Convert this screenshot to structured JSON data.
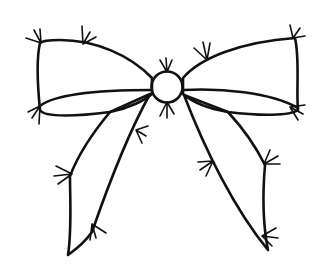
{
  "image": {
    "subject": "ribbon bow illustration",
    "description": "Black outline drawing of a bow with two loops, a round center knot and two hanging tails, filled with light gray grid texture, with small stitch/tick marks along the edges",
    "colors": {
      "background": "#ffffff",
      "outline": "#111111",
      "fill": "#e2e2e2",
      "fill_grid": "#cfcfcf"
    },
    "parts": [
      "left-loop",
      "right-loop",
      "center-knot",
      "left-tail",
      "right-tail"
    ],
    "stitch_mark_count": 14
  }
}
